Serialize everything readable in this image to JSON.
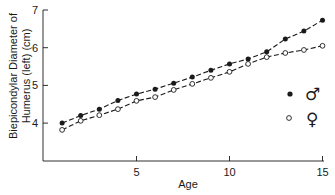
{
  "chart_data": {
    "type": "line",
    "title": "",
    "xlabel": "Age",
    "ylabel": [
      "Biepicondylar Diameter of",
      "Humerus (left) (cm)"
    ],
    "xlim": [
      0,
      15
    ],
    "ylim": [
      3,
      7
    ],
    "x_ticks": [
      5,
      10,
      15
    ],
    "y_ticks": [
      4,
      5,
      6,
      7
    ],
    "grid": false,
    "legend_position": "right-middle",
    "x": [
      1,
      2,
      3,
      4,
      5,
      6,
      7,
      8,
      9,
      10,
      11,
      12,
      13,
      14,
      15
    ],
    "series": [
      {
        "name": "Male",
        "symbol": "♂",
        "marker": "filled-circle",
        "values": [
          4.0,
          4.2,
          4.37,
          4.6,
          4.77,
          4.9,
          5.06,
          5.22,
          5.4,
          5.57,
          5.7,
          5.89,
          6.23,
          6.44,
          6.73
        ]
      },
      {
        "name": "Female",
        "symbol": "♀",
        "marker": "open-circle",
        "values": [
          3.82,
          4.06,
          4.21,
          4.37,
          4.59,
          4.69,
          4.88,
          5.04,
          5.2,
          5.36,
          5.57,
          5.75,
          5.86,
          5.94,
          6.05
        ]
      }
    ]
  },
  "layout": {
    "plot_left": 43,
    "plot_right": 335,
    "plot_top": 10,
    "plot_bottom": 161,
    "x0_px": 43.5,
    "x_per_unit": 18.6,
    "y7_px": 10,
    "y_per_unit": 37.7,
    "line_color": "#1a1a1a"
  }
}
